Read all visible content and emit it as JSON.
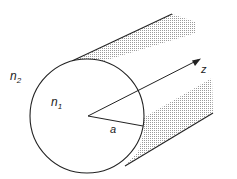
{
  "diagram": {
    "labels": {
      "outer_index": "n",
      "outer_index_sub": "2",
      "core_index": "n",
      "core_index_sub": "1",
      "radius": "a",
      "axis": "z"
    },
    "colors": {
      "stroke": "#222222",
      "shading": "#9a9a9a",
      "background": "#ffffff"
    }
  }
}
